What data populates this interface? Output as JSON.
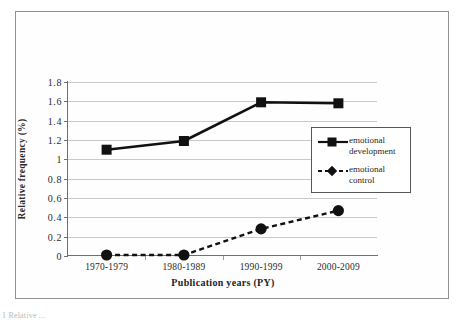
{
  "figure": {
    "caption_fragment": "1 Relative ..."
  },
  "chart_data": {
    "type": "line",
    "title": "",
    "xlabel": "Publication years (PY)",
    "ylabel": "Relative frequency (%)",
    "categories": [
      "1970-1979",
      "1980-1989",
      "1990-1999",
      "2000-2009"
    ],
    "ylim": [
      0,
      1.8
    ],
    "ytick_labels": [
      "0",
      "0.2",
      "0.4",
      "0.6",
      "0.8",
      "1",
      "1.2",
      "1.4",
      "1.6",
      "1.8"
    ],
    "ytick_values": [
      0,
      0.2,
      0.4,
      0.6,
      0.8,
      1.0,
      1.2,
      1.4,
      1.6,
      1.8
    ],
    "grid": true,
    "legend_position": "center-right",
    "series": [
      {
        "name": "emotional development",
        "label_line1": "emotional",
        "label_line2": "development",
        "values": [
          1.1,
          1.19,
          1.59,
          1.58
        ],
        "line_style": "solid",
        "marker": "square",
        "color": "#111111"
      },
      {
        "name": "emotional control",
        "label_line1": "emotional",
        "label_line2": "control",
        "values": [
          0.01,
          0.01,
          0.28,
          0.47
        ],
        "line_style": "dashed",
        "marker": "diamond",
        "color": "#111111"
      }
    ]
  },
  "colors": {
    "frame": "#8f9193",
    "axis": "#6d6f71",
    "gridline": "#c9c9c9",
    "series": "#111111",
    "text": "#2b2b2b"
  }
}
